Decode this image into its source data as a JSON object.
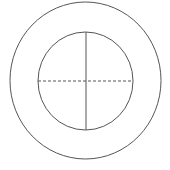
{
  "diagram": {
    "type": "concentric-circles",
    "stroke_color": "#555555",
    "outer_circle": {
      "cx": 85.5,
      "cy": 80.5,
      "rx": 75.5,
      "ry": 78.5
    },
    "inner_circle": {
      "cx": 85.5,
      "cy": 81,
      "rx": 47.5,
      "ry": 49
    },
    "vertical_line": {
      "x": 86,
      "y1": 32,
      "y2": 130,
      "style": "solid"
    },
    "horizontal_line": {
      "y": 81,
      "x1": 38,
      "x2": 133,
      "style": "dashed"
    }
  }
}
